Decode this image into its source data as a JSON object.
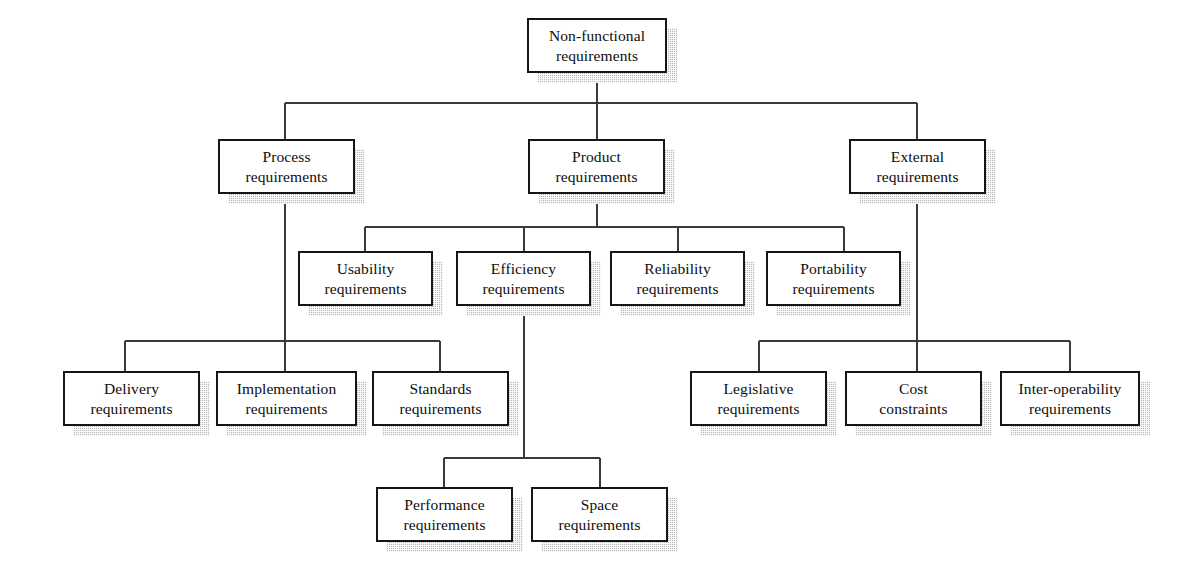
{
  "diagram": {
    "type": "tree-hierarchy",
    "canvas": {
      "width": 1181,
      "height": 584
    },
    "style": {
      "background": "#ffffff",
      "box_fill": "#ffffff",
      "box_border": "#161616",
      "shadow": "#b9b9b9",
      "line": "#3a3a3a",
      "text": "#0d0d0d"
    },
    "nodes": [
      {
        "id": "non-functional",
        "label": "Non-functional\nrequirements",
        "line1": "Non-functional",
        "line2": "requirements",
        "x": 527,
        "y": 18,
        "w": 140,
        "h": 55
      },
      {
        "id": "process",
        "label": "Process\nrequirements",
        "line1": "Process",
        "line2": "requirements",
        "x": 218,
        "y": 139,
        "w": 137,
        "h": 55
      },
      {
        "id": "product",
        "label": "Product\nrequirements",
        "line1": "Product",
        "line2": "requirements",
        "x": 528,
        "y": 139,
        "w": 137,
        "h": 55
      },
      {
        "id": "external",
        "label": "External\nrequirements",
        "line1": "External",
        "line2": "requirements",
        "x": 849,
        "y": 139,
        "w": 137,
        "h": 55
      },
      {
        "id": "usability",
        "label": "Usability\nrequirements",
        "line1": "Usability",
        "line2": "requirements",
        "x": 298,
        "y": 251,
        "w": 135,
        "h": 55
      },
      {
        "id": "efficiency",
        "label": "Efficiency\nrequirements",
        "line1": "Efficiency",
        "line2": "requirements",
        "x": 456,
        "y": 251,
        "w": 135,
        "h": 55
      },
      {
        "id": "reliability",
        "label": "Reliability\nrequirements",
        "line1": "Reliability",
        "line2": "requirements",
        "x": 610,
        "y": 251,
        "w": 135,
        "h": 55
      },
      {
        "id": "portability",
        "label": "Portability\nrequirements",
        "line1": "Portability",
        "line2": "requirements",
        "x": 766,
        "y": 251,
        "w": 135,
        "h": 55
      },
      {
        "id": "delivery",
        "label": "Delivery\nrequirements",
        "line1": "Delivery",
        "line2": "requirements",
        "x": 63,
        "y": 371,
        "w": 137,
        "h": 55
      },
      {
        "id": "implementation",
        "label": "Implementation\nrequirements",
        "line1": "Implementation",
        "line2": "requirements",
        "x": 216,
        "y": 371,
        "w": 141,
        "h": 55
      },
      {
        "id": "standards",
        "label": "Standards\nrequirements",
        "line1": "Standards",
        "line2": "requirements",
        "x": 372,
        "y": 371,
        "w": 137,
        "h": 55
      },
      {
        "id": "legislative",
        "label": "Legislative\nrequirements",
        "line1": "Legislative",
        "line2": "requirements",
        "x": 690,
        "y": 371,
        "w": 137,
        "h": 55
      },
      {
        "id": "cost",
        "label": "Cost\nconstraints",
        "line1": "Cost",
        "line2": "constraints",
        "x": 845,
        "y": 371,
        "w": 137,
        "h": 55
      },
      {
        "id": "interoperability",
        "label": "Inter-operability\nrequirements",
        "line1": "Inter-operability",
        "line2": "requirements",
        "x": 1000,
        "y": 371,
        "w": 140,
        "h": 55
      },
      {
        "id": "performance",
        "label": "Performance\nrequirements",
        "line1": "Performance",
        "line2": "requirements",
        "x": 376,
        "y": 487,
        "w": 137,
        "h": 55
      },
      {
        "id": "space",
        "label": "Space\nrequirements",
        "line1": "Space",
        "line2": "requirements",
        "x": 531,
        "y": 487,
        "w": 137,
        "h": 55
      }
    ],
    "edges": [
      {
        "from": "non-functional",
        "to": [
          "process",
          "product",
          "external"
        ]
      },
      {
        "from": "product",
        "to": [
          "usability",
          "efficiency",
          "reliability",
          "portability"
        ]
      },
      {
        "from": "process",
        "to": [
          "implementation"
        ]
      },
      {
        "from": "efficiency",
        "to": [
          "performance",
          "space"
        ]
      },
      {
        "from": "external",
        "to": [
          "cost"
        ]
      },
      {
        "from": "bus-left",
        "to": [
          "delivery",
          "implementation",
          "standards"
        ]
      },
      {
        "from": "bus-right",
        "to": [
          "legislative",
          "cost",
          "interoperability"
        ]
      }
    ]
  }
}
